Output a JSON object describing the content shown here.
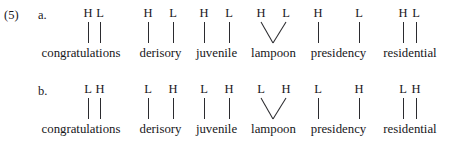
{
  "figure": {
    "example_number": "(5)",
    "type": "autosegmental-tone-association-diagram",
    "ink_color": "#17171a",
    "background_color": "#ffffff"
  },
  "rows": [
    {
      "letter": "a.",
      "pattern": "HL",
      "items": [
        {
          "word": "congratulations",
          "tones": [
            "H",
            "L"
          ],
          "association": "adjacent-vertical",
          "tone_x": [
            50,
            62
          ],
          "line_x": [
            50,
            62
          ],
          "left": 38,
          "width": 86
        },
        {
          "word": "derisory",
          "tones": [
            "H",
            "L"
          ],
          "association": "spread-vertical",
          "tone_x": [
            15,
            40
          ],
          "line_x": [
            15,
            40
          ],
          "left": 133,
          "width": 55
        },
        {
          "word": "juvenile",
          "tones": [
            "H",
            "L"
          ],
          "association": "spread-vertical",
          "tone_x": [
            13,
            38
          ],
          "line_x": [
            13,
            38
          ],
          "left": 191,
          "width": 51
        },
        {
          "word": "lampoon",
          "tones": [
            "H",
            "L"
          ],
          "association": "converging-v",
          "tone_x": [
            14,
            39
          ],
          "line_x": [
            26,
            26
          ],
          "left": 247,
          "width": 53
        },
        {
          "word": "presidency",
          "tones": [
            "H",
            "L"
          ],
          "association": "spread-vertical",
          "tone_x": [
            15,
            56
          ],
          "line_x": [
            15,
            56
          ],
          "left": 303,
          "width": 71
        },
        {
          "word": "residential",
          "tones": [
            "H",
            "L"
          ],
          "association": "adjacent-vertical",
          "tone_x": [
            25,
            38
          ],
          "line_x": [
            25,
            38
          ],
          "left": 378,
          "width": 64
        }
      ]
    },
    {
      "letter": "b.",
      "pattern": "LH",
      "items": [
        {
          "word": "congratulations",
          "tones": [
            "L",
            "H"
          ],
          "association": "adjacent-vertical",
          "tone_x": [
            50,
            62
          ],
          "line_x": [
            50,
            62
          ],
          "left": 38,
          "width": 86
        },
        {
          "word": "derisory",
          "tones": [
            "L",
            "H"
          ],
          "association": "spread-vertical",
          "tone_x": [
            15,
            40
          ],
          "line_x": [
            15,
            40
          ],
          "left": 133,
          "width": 55
        },
        {
          "word": "juvenile",
          "tones": [
            "L",
            "H"
          ],
          "association": "spread-vertical",
          "tone_x": [
            13,
            38
          ],
          "line_x": [
            13,
            38
          ],
          "left": 191,
          "width": 51
        },
        {
          "word": "lampoon",
          "tones": [
            "L",
            "H"
          ],
          "association": "converging-v",
          "tone_x": [
            14,
            39
          ],
          "line_x": [
            26,
            26
          ],
          "left": 247,
          "width": 53
        },
        {
          "word": "presidency",
          "tones": [
            "L",
            "H"
          ],
          "association": "spread-vertical",
          "tone_x": [
            15,
            56
          ],
          "line_x": [
            15,
            56
          ],
          "left": 303,
          "width": 71
        },
        {
          "word": "residential",
          "tones": [
            "L",
            "H"
          ],
          "association": "adjacent-vertical",
          "tone_x": [
            25,
            38
          ],
          "line_x": [
            25,
            38
          ],
          "left": 378,
          "width": 64
        }
      ]
    }
  ],
  "row_letter_positions": [
    {
      "left": 38,
      "top": 8
    },
    {
      "left": 38,
      "top": 84
    }
  ]
}
